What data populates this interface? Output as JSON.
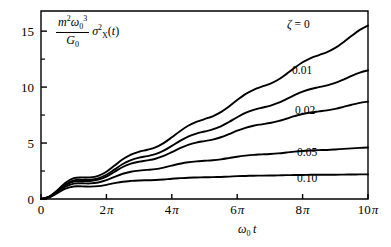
{
  "chart_data": {
    "type": "line",
    "title": "",
    "xlabel": "ω₀ t",
    "ylabel": "(m² ω₀³ / G₀) σ²_X(t)",
    "xlim": [
      0,
      31.4159
    ],
    "ylim": [
      0,
      16.8
    ],
    "grid": false,
    "legend_position": "inline-right-of-curves",
    "x_tick_values": [
      0,
      6.2832,
      12.5664,
      18.8496,
      25.1327,
      31.4159
    ],
    "x_tick_labels": [
      "0",
      "2π",
      "4π",
      "6π",
      "8π",
      "10π"
    ],
    "y_tick_values": [
      0,
      5,
      10,
      15
    ],
    "y_tick_labels": [
      "0",
      "5",
      "10",
      "15"
    ],
    "y_minor_ticks": [
      2.5,
      7.5,
      12.5
    ],
    "x_unit": "radians",
    "series": [
      {
        "name": "ζ = 0",
        "label": "ζ = 0",
        "zeta": 0,
        "color": "#000000",
        "end_value": 15.5,
        "x": [
          0,
          0.7854,
          1.5708,
          2.3562,
          3.1416,
          3.927,
          4.7124,
          5.4978,
          6.2832,
          7.0686,
          7.854,
          8.6394,
          9.4248,
          10.2102,
          10.9956,
          11.781,
          12.5664,
          13.3518,
          14.1372,
          14.9226,
          15.708,
          16.4934,
          17.2788,
          18.0642,
          18.8496,
          19.635,
          20.4204,
          21.2058,
          21.9911,
          22.7765,
          23.5619,
          24.3473,
          25.1327,
          25.9181,
          26.7035,
          27.4889,
          28.2743,
          29.0597,
          29.8451,
          30.6305,
          31.4159
        ],
        "y": [
          0,
          0.18,
          0.68,
          1.26,
          1.62,
          1.68,
          1.68,
          1.8,
          2.12,
          2.6,
          3.09,
          3.46,
          3.68,
          3.83,
          4.02,
          4.35,
          4.8,
          5.28,
          5.7,
          6.0,
          6.22,
          6.44,
          6.76,
          7.2,
          7.7,
          8.16,
          8.5,
          8.74,
          8.96,
          9.28,
          9.72,
          10.2,
          10.64,
          10.97,
          11.2,
          11.44,
          11.76,
          12.2,
          12.7,
          13.16,
          13.5
        ]
      },
      {
        "name": "ζ = 0.01",
        "label": "0.01",
        "zeta": 0.01,
        "color": "#000000",
        "end_value": 11.5,
        "x": [
          0,
          0.7854,
          1.5708,
          2.3562,
          3.1416,
          3.927,
          4.7124,
          5.4978,
          6.2832,
          7.0686,
          7.854,
          8.6394,
          9.4248,
          10.2102,
          10.9956,
          11.781,
          12.5664,
          13.3518,
          14.1372,
          14.9226,
          15.708,
          16.4934,
          17.2788,
          18.0642,
          18.8496,
          19.635,
          20.4204,
          21.2058,
          21.9911,
          22.7765,
          23.5619,
          24.3473,
          25.1327,
          25.9181,
          26.7035,
          27.4889,
          28.2743,
          29.0597,
          29.8451,
          30.6305,
          31.4159
        ],
        "y": [
          0,
          0.17,
          0.66,
          1.22,
          1.57,
          1.62,
          1.62,
          1.74,
          2.04,
          2.49,
          2.95,
          3.28,
          3.48,
          3.61,
          3.78,
          4.07,
          4.47,
          4.89,
          5.25,
          5.5,
          5.68,
          5.86,
          6.12,
          6.48,
          6.88,
          7.24,
          7.5,
          7.68,
          7.84,
          8.08,
          8.4,
          8.74,
          9.04,
          9.26,
          9.41,
          9.56,
          9.77,
          10.05,
          10.36,
          10.63,
          10.83
        ]
      },
      {
        "name": "ζ = 0.02",
        "label": "0.02",
        "zeta": 0.02,
        "color": "#000000",
        "end_value": 8.7,
        "x": [
          0,
          0.7854,
          1.5708,
          2.3562,
          3.1416,
          3.927,
          4.7124,
          5.4978,
          6.2832,
          7.0686,
          7.854,
          8.6394,
          9.4248,
          10.2102,
          10.9956,
          11.781,
          12.5664,
          13.3518,
          14.1372,
          14.9226,
          15.708,
          16.4934,
          17.2788,
          18.0642,
          18.8496,
          19.635,
          20.4204,
          21.2058,
          21.9911,
          22.7765,
          23.5619,
          24.3473,
          25.1327,
          25.9181,
          26.7035,
          27.4889,
          28.2743,
          29.0597,
          29.8451,
          30.6305,
          31.4159
        ],
        "y": [
          0,
          0.165,
          0.64,
          1.18,
          1.5,
          1.55,
          1.55,
          1.66,
          1.93,
          2.34,
          2.75,
          3.04,
          3.21,
          3.32,
          3.46,
          3.7,
          4.03,
          4.37,
          4.65,
          4.85,
          4.98,
          5.11,
          5.31,
          5.58,
          5.87,
          6.12,
          6.3,
          6.42,
          6.53,
          6.69,
          6.9,
          7.12,
          7.31,
          7.44,
          7.53,
          7.62,
          7.75,
          7.92,
          8.1,
          8.26,
          8.37
        ]
      },
      {
        "name": "ζ = 0.05",
        "label": "0.05",
        "zeta": 0.05,
        "color": "#000000",
        "end_value": 4.6,
        "x": [
          0,
          0.7854,
          1.5708,
          2.3562,
          3.1416,
          3.927,
          4.7124,
          5.4978,
          6.2832,
          7.0686,
          7.854,
          8.6394,
          9.4248,
          10.2102,
          10.9956,
          11.781,
          12.5664,
          13.3518,
          14.1372,
          14.9226,
          15.708,
          16.4934,
          17.2788,
          18.0642,
          18.8496,
          19.635,
          20.4204,
          21.2058,
          21.9911,
          22.7765,
          23.5619,
          24.3473,
          25.1327,
          25.9181,
          26.7035,
          27.4889,
          28.2743,
          29.0597,
          29.8451,
          30.6305,
          31.4159
        ],
        "y": [
          0,
          0.155,
          0.59,
          1.07,
          1.34,
          1.37,
          1.36,
          1.44,
          1.64,
          1.93,
          2.2,
          2.38,
          2.48,
          2.54,
          2.61,
          2.74,
          2.91,
          3.07,
          3.2,
          3.28,
          3.33,
          3.38,
          3.46,
          3.57,
          3.69,
          3.78,
          3.85,
          3.89,
          3.93,
          3.98,
          4.05,
          4.13,
          4.19,
          4.23,
          4.26,
          4.28,
          4.32,
          4.37,
          4.42,
          4.46,
          4.49
        ]
      },
      {
        "name": "ζ = 0.10",
        "label": "0.10",
        "zeta": 0.1,
        "color": "#000000",
        "end_value": 2.2,
        "x": [
          0,
          0.7854,
          1.5708,
          2.3562,
          3.1416,
          3.927,
          4.7124,
          5.4978,
          6.2832,
          7.0686,
          7.854,
          8.6394,
          9.4248,
          10.2102,
          10.9956,
          11.781,
          12.5664,
          13.3518,
          14.1372,
          14.9226,
          15.708,
          16.4934,
          17.2788,
          18.0642,
          18.8496,
          19.635,
          20.4204,
          21.2058,
          21.9911,
          22.7765,
          23.5619,
          24.3473,
          25.1327,
          25.9181,
          26.7035,
          27.4889,
          28.2743,
          29.0597,
          29.8451,
          30.6305,
          31.4159
        ],
        "y": [
          0,
          0.14,
          0.53,
          0.93,
          1.13,
          1.14,
          1.12,
          1.16,
          1.28,
          1.43,
          1.56,
          1.63,
          1.67,
          1.69,
          1.71,
          1.76,
          1.83,
          1.88,
          1.92,
          1.94,
          1.96,
          1.97,
          1.99,
          2.02,
          2.06,
          2.08,
          2.1,
          2.11,
          2.12,
          2.13,
          2.15,
          2.16,
          2.17,
          2.18,
          2.18,
          2.19,
          2.19,
          2.2,
          2.21,
          2.22,
          2.22
        ]
      }
    ]
  },
  "axes": {
    "y_ticks": [
      {
        "label": "15",
        "value": 15
      },
      {
        "label": "10",
        "value": 10
      },
      {
        "label": "5",
        "value": 5
      },
      {
        "label": "0",
        "value": 0
      }
    ],
    "x_ticks": [
      {
        "label": "0",
        "coeff": "",
        "symbol": "",
        "value": 0
      },
      {
        "label": "2π",
        "coeff": "2",
        "symbol": "π",
        "value": 6.2832
      },
      {
        "label": "4π",
        "coeff": "4",
        "symbol": "π",
        "value": 12.5664
      },
      {
        "label": "6π",
        "coeff": "6",
        "symbol": "π",
        "value": 18.8496
      },
      {
        "label": "8π",
        "coeff": "8",
        "symbol": "π",
        "value": 25.1327
      },
      {
        "label": "10π",
        "coeff": "10",
        "symbol": "π",
        "value": 31.4159
      }
    ]
  },
  "ylabel_parts": {
    "numerator_m": "m",
    "numerator_m_sup": "2",
    "numerator_omega": "ω",
    "numerator_omega_sub": "0",
    "numerator_omega_sup": "3",
    "denominator_G": "G",
    "denominator_G_sub": "0",
    "sigma": "σ",
    "sigma_sup": "2",
    "sigma_sub": "X",
    "arg_open": "(",
    "arg_t": "t",
    "arg_close": ")"
  },
  "xlabel_parts": {
    "omega": "ω",
    "omega_sub": "0",
    "t": "t"
  },
  "curve_labels": [
    {
      "text": "ζ = 0",
      "name": "curve-label-zeta-0"
    },
    {
      "text": "0.01",
      "name": "curve-label-zeta-001"
    },
    {
      "text": "0.02",
      "name": "curve-label-zeta-002"
    },
    {
      "text": "0.05",
      "name": "curve-label-zeta-005"
    },
    {
      "text": "0.10",
      "name": "curve-label-zeta-010"
    }
  ],
  "style": {
    "line_color": "#000000",
    "axis_color": "#000000",
    "background": "#ffffff"
  }
}
